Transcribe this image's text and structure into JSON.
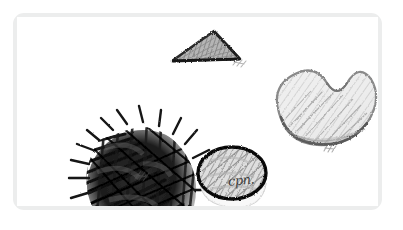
{
  "panel": {
    "title": "Pencil sketch panel",
    "frame_color": "#eceded",
    "background_color": "#ffffff",
    "paper_color": "#ffffff"
  },
  "drawing": {
    "medium": "graphite pencil sketch",
    "stroke_dark": "#1a1a1a",
    "stroke_mid": "#6e6e6e",
    "stroke_light": "#b4b4b4",
    "fill_light": "#e8e8e8",
    "objects": [
      {
        "id": "scribble-mass",
        "name": "dark scribbled spiky blob",
        "shape": "irregular round spiky mass",
        "shading": "dense heavy scribble",
        "tone": "very dark",
        "bbox": [
          47,
          68,
          103,
          110
        ]
      },
      {
        "id": "triangle",
        "name": "flat shaded triangle",
        "shape": "wide low triangle",
        "shading": "diagonal hatching",
        "tone": "mid gray",
        "bbox": [
          172,
          30,
          70,
          32
        ]
      },
      {
        "id": "bean",
        "name": "kidney bean / cashew shape",
        "shape": "curved kidney outline",
        "shading": "light hatching with dark lower contour",
        "tone": "light gray",
        "bbox": [
          272,
          63,
          98,
          88
        ]
      },
      {
        "id": "circle",
        "name": "hatched circle with heavy outline",
        "shape": "round disc",
        "shading": "diagonal hatching",
        "tone": "mid gray with black outline",
        "bbox": [
          182,
          133,
          70,
          52
        ]
      }
    ],
    "annotations": [
      {
        "id": "sig-circle",
        "text": "cpn.",
        "near": "circle"
      },
      {
        "id": "mark-blob",
        "text": "",
        "near": "scribble-mass"
      },
      {
        "id": "mark-triangle",
        "text": "",
        "near": "triangle"
      },
      {
        "id": "mark-bean",
        "text": "",
        "near": "bean"
      }
    ]
  }
}
